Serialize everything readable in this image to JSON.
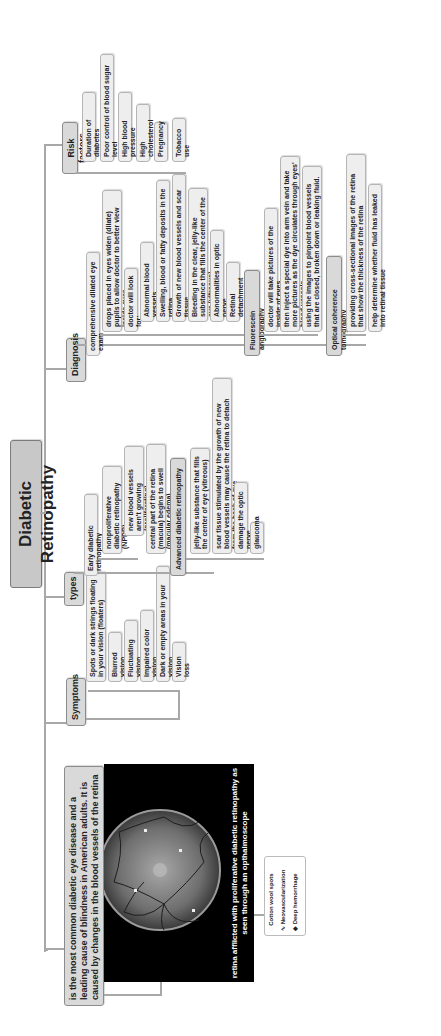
{
  "root": {
    "label": "Diabetic Retinopathy"
  },
  "definition": {
    "text": "is the most common diabetic eye disease and a leading cause of blindness in American adults. It is caused by changes in the blood vessels of the retina"
  },
  "image": {
    "caption": "retina afflicted with proliferative diabetic retinopathy as seen through an opthalmoscope",
    "legend": [
      "Cotton wool spots",
      "Neovascularization",
      "Deep hemorrhage"
    ]
  },
  "symptoms": {
    "label": "Symptoms",
    "items": [
      "Spots or dark strings floating in your vision (floaters)",
      "Blurred vision",
      "Fluctuating vision",
      "Impaired color vision",
      "Dark or empty areas in your vision",
      "Vision loss"
    ]
  },
  "types": {
    "label": "types",
    "early": {
      "label": "Early diabetic retinopathy",
      "items": [
        "nonproliferative diabetic retinopathy (NPDR)",
        "new blood vessels aren't growing (proliferating)",
        "central part of the retina (macula) begins to swell (macular edema)"
      ]
    },
    "advanced": {
      "label": "Advanced diabetic retinopathy",
      "items": [
        "jelly-like substance that fills the center of eye (vitreous)",
        "scar tissue stimulated by the growth of new blood vessels may cause the retina to detach from the back of eye",
        "damage the optic nerve",
        "glaucoma"
      ]
    }
  },
  "diagnosis": {
    "label": "Diagnosis",
    "dilated": {
      "label": "comprehensive dilated eye exam",
      "items": [
        "drops placed in eyes widen (dilate) pupils to allow doctor to better view inside eyes",
        "doctor will look for:",
        "Abnormal blood vessels",
        "Swelling, blood or fatty deposits in the retina",
        "Growth of new blood vessels and scar tissue",
        "Bleeding in the clear, jelly-like substance that fills the center of the eye (vitreous)",
        "Abnormalities in optic nerve",
        "Retinal detachment"
      ]
    },
    "angiography": {
      "label": "Fluorescein angiography",
      "items": [
        "doctor will take pictures of the inside of eyes",
        "then inject a special dye into arm vein and take more pictures as the dye circulates through eyes' blood vessels",
        "using the images to pinpoint blood vessels that are closed, broken down or leaking fluid."
      ]
    },
    "oct": {
      "label": "Optical coherence tomography",
      "items": [
        "providing cross-sectional images of the retina that show the thickness of the retina",
        "help determine whether fluid has leaked into retinal tissue"
      ]
    }
  },
  "risk_factors": {
    "label": "Risk factors",
    "items": [
      "Duration of diabetes",
      "Poor control of blood sugar level",
      "High blood pressure",
      "High cholesterol",
      "Pregnancy",
      "Tobacco use"
    ]
  }
}
